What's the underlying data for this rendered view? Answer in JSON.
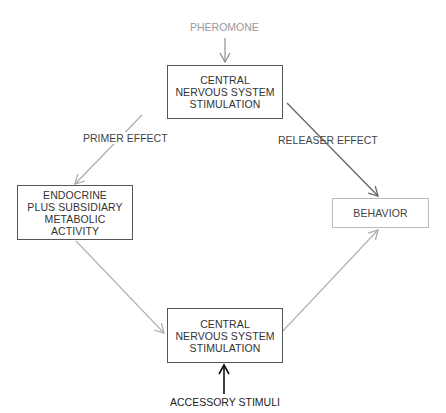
{
  "diagram": {
    "title_input": "PHEROMONE",
    "nodes": {
      "cns_top": {
        "lines": [
          "CENTRAL",
          "NERVOUS SYSTEM",
          "STIMULATION"
        ]
      },
      "endocrine": {
        "lines": [
          "ENDOCRINE",
          "PLUS SUBSIDIARY",
          "METABOLIC",
          "ACTIVITY"
        ]
      },
      "behavior": {
        "lines": [
          "BEHAVIOR"
        ]
      },
      "cns_bottom": {
        "lines": [
          "CENTRAL",
          "NERVOUS SYSTEM",
          "STIMULATION"
        ]
      }
    },
    "edges": {
      "primer": "PRIMER EFFECT",
      "releaser": "RELEASER EFFECT"
    },
    "bottom_input": "ACCESSORY STIMULI",
    "colors": {
      "dark_line": "#555555",
      "mid_line": "#777777",
      "light_line": "#b0b0b0",
      "input_text": "#999999",
      "arrow_black": "#111111"
    }
  }
}
